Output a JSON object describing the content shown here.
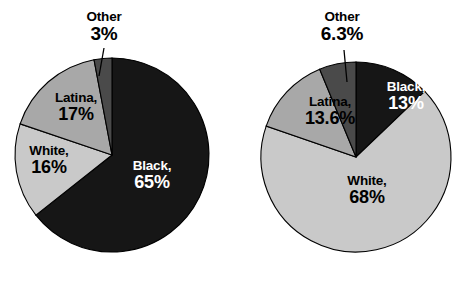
{
  "figure": {
    "background": "#ffffff",
    "width": 467,
    "height": 282
  },
  "chart_data": [
    {
      "type": "pie",
      "id": "left-pie",
      "title": "",
      "labels": [
        "Black",
        "White",
        "Latina",
        "Other"
      ],
      "values": [
        65,
        16,
        17,
        3
      ],
      "value_labels": [
        "65%",
        "16%",
        "17%",
        "3%"
      ],
      "colors": [
        "#161616",
        "#c9c9c9",
        "#a8a8a8",
        "#4a4a4a"
      ],
      "label_texts": [
        "Black,",
        "White,",
        "Latina,",
        "Other"
      ],
      "start_angle_deg": 0,
      "direction": "clockwise",
      "center": [
        112,
        155
      ],
      "radius": 97,
      "legend": "none",
      "grid": false
    },
    {
      "type": "pie",
      "id": "right-pie",
      "title": "",
      "labels": [
        "Black",
        "White",
        "Latina",
        "Other"
      ],
      "values": [
        13,
        68,
        13.6,
        6.3
      ],
      "value_labels": [
        "13%",
        "68%",
        "13.6%",
        "6.3%"
      ],
      "colors": [
        "#161616",
        "#c9c9c9",
        "#a8a8a8",
        "#4a4a4a"
      ],
      "label_texts": [
        "Black,",
        "White,",
        "Latina,",
        "Other"
      ],
      "start_angle_deg": 0,
      "direction": "clockwise",
      "center": [
        356,
        157
      ],
      "radius": 95,
      "legend": "none",
      "grid": false
    }
  ],
  "left_chart": {
    "black": {
      "name": "Black,",
      "value": "65%"
    },
    "white": {
      "name": "White,",
      "value": "16%"
    },
    "latina": {
      "name": "Latina,",
      "value": "17%"
    },
    "other": {
      "name": "Other",
      "value": "3%"
    }
  },
  "right_chart": {
    "black": {
      "name": "Black,",
      "value": "13%"
    },
    "white": {
      "name": "White,",
      "value": "68%"
    },
    "latina": {
      "name": "Latina,",
      "value": "13.6%"
    },
    "other": {
      "name": "Other",
      "value": "6.3%"
    }
  },
  "colors": {
    "slice_black": "#161616",
    "slice_white": "#c9c9c9",
    "slice_latina": "#a8a8a8",
    "slice_other": "#4a4a4a",
    "outline": "#000000",
    "text_on_dark": "#ffffff",
    "text_on_light": "#000000"
  }
}
